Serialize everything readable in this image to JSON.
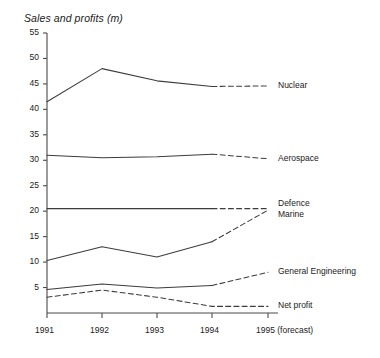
{
  "chart_data": {
    "type": "line",
    "title": "Sales and profits (m)",
    "xlabel": "",
    "ylabel": "",
    "grid": false,
    "legend_position": "right-inline-labels",
    "x": [
      "1991",
      "1992",
      "1993",
      "1994",
      "1995 (forecast)"
    ],
    "xlim": [
      1991,
      1995
    ],
    "ylim": [
      0,
      55
    ],
    "ytick_labels": [
      "55",
      "50",
      "45",
      "40",
      "35",
      "30",
      "25",
      "20",
      "15",
      "10",
      "5"
    ],
    "ytick_values": [
      55,
      50,
      45,
      40,
      35,
      30,
      25,
      20,
      15,
      10,
      5
    ],
    "forecast_from": "1994",
    "forecast_style": "dashed",
    "series": [
      {
        "name": "Nuclear",
        "label": "Nuclear",
        "values": [
          41.5,
          48.0,
          45.6,
          44.5,
          44.6
        ],
        "style": "solid-then-dashed"
      },
      {
        "name": "Aerospace",
        "label": "Aerospace",
        "values": [
          31.0,
          30.5,
          30.7,
          31.2,
          30.3
        ],
        "style": "solid-then-dashed"
      },
      {
        "name": "Defence",
        "label": "Defence",
        "values": [
          20.5,
          20.5,
          20.5,
          20.5,
          20.5
        ],
        "style": "solid-then-dashed"
      },
      {
        "name": "Marine",
        "label": "Marine",
        "values": [
          10.3,
          13.0,
          11.0,
          14.0,
          20.2
        ],
        "style": "solid-then-dashed"
      },
      {
        "name": "General Engineering",
        "label": "General Engineering",
        "values": [
          4.6,
          5.7,
          4.9,
          5.4,
          8.0
        ],
        "style": "solid-then-dashed"
      },
      {
        "name": "Net profit",
        "label": "Net profit",
        "values": [
          3.1,
          4.5,
          3.1,
          1.3,
          1.3
        ],
        "style": "dashed"
      }
    ],
    "colors": {
      "line": "#3c3c3c",
      "axis": "#4a4a4a",
      "text": "#1a1a1a",
      "background": "#ffffff"
    }
  }
}
